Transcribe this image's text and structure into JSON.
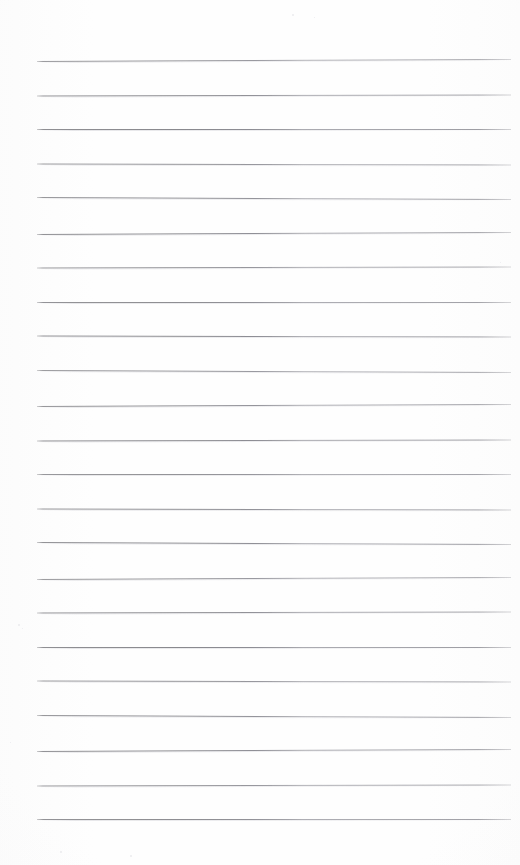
{
  "page": {
    "kind": "scanned-blank-lined-notebook-page",
    "title": "",
    "background_color": "#fefefe",
    "width": 520,
    "height": 865,
    "has_text": false,
    "text_content": ""
  },
  "ruling": {
    "line_color": "#8b8b8f",
    "line_color_right_half": "#a4a4aa",
    "line_thickness_px": 1,
    "line_count": 23,
    "first_line_y": 60,
    "line_spacing_px": 34.5,
    "line_left_x": 37,
    "line_right_x": 511,
    "top_margin_px": 60,
    "bottom_margin_px": 45,
    "left_margin_px": 37,
    "right_margin_px": 9,
    "lines_y": [
      60,
      94.5,
      129,
      163.5,
      198,
      232.5,
      267,
      301.5,
      336,
      370.5,
      405,
      439.5,
      474,
      508.5,
      543,
      577.5,
      612,
      646.5,
      681,
      715.5,
      750,
      784.5,
      819
    ]
  },
  "speckles": [
    {
      "x": 292,
      "y": 14,
      "size": 2
    },
    {
      "x": 314,
      "y": 17,
      "size": 1
    },
    {
      "x": 18,
      "y": 624,
      "size": 2
    },
    {
      "x": 22,
      "y": 628,
      "size": 1
    },
    {
      "x": 60,
      "y": 851,
      "size": 2
    },
    {
      "x": 130,
      "y": 855,
      "size": 2
    },
    {
      "x": 10,
      "y": 742,
      "size": 1
    },
    {
      "x": 500,
      "y": 262,
      "size": 1
    }
  ]
}
